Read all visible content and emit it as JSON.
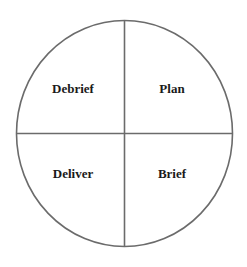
{
  "diagram": {
    "type": "four-quadrant cycle circle",
    "quadrants": [
      {
        "position": "top-left",
        "label": "Debrief"
      },
      {
        "position": "top-right",
        "label": "Plan"
      },
      {
        "position": "bottom-left",
        "label": "Deliver"
      },
      {
        "position": "bottom-right",
        "label": "Brief"
      }
    ],
    "colors": {
      "stroke": "#6b6b6b",
      "text": "#1a1a1a",
      "background": "#ffffff"
    }
  }
}
